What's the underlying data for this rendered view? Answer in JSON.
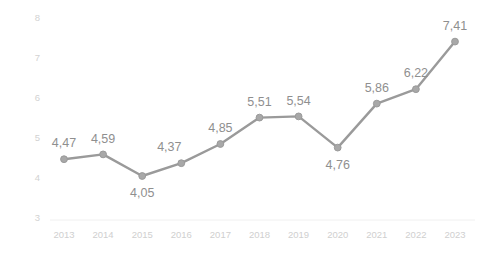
{
  "chart_data": {
    "type": "line",
    "title": "",
    "subtitle": "",
    "xlabel": "",
    "ylabel": "",
    "categories": [
      "2013",
      "2014",
      "2015",
      "2016",
      "2017",
      "2018",
      "2019",
      "2020",
      "2021",
      "2022",
      "2023"
    ],
    "values": [
      4.47,
      4.59,
      4.05,
      4.37,
      4.85,
      5.51,
      5.54,
      4.76,
      5.86,
      6.22,
      7.41
    ],
    "point_labels": [
      "4,47",
      "4,59",
      "4,05",
      "4,37",
      "4,85",
      "5,51",
      "5,54",
      "4,76",
      "5,86",
      "6,22",
      "7,41"
    ],
    "label_positions": [
      "above",
      "above",
      "below",
      "above",
      "above",
      "above",
      "above",
      "below",
      "above",
      "above",
      "above"
    ],
    "ylim": [
      3,
      8
    ],
    "yticks": [
      3,
      4,
      5,
      6,
      7,
      8
    ],
    "ytick_labels": [
      "3",
      "4",
      "5",
      "6",
      "7",
      "8"
    ],
    "xtick_labels": [
      "2013",
      "2014",
      "2015",
      "2016",
      "2017",
      "2018",
      "2019",
      "2020",
      "2021",
      "2022",
      "2023"
    ],
    "grid": false,
    "legend": null,
    "legend_position": "none",
    "series": [
      {
        "name": "series-1",
        "values": [
          4.47,
          4.59,
          4.05,
          4.37,
          4.85,
          5.51,
          5.54,
          4.76,
          5.86,
          6.22,
          7.41
        ]
      }
    ],
    "colors": {
      "line": "#9a9a9a",
      "marker": "#a8a8a8",
      "point_label": "#8f8f8f",
      "tick_label": "#d0d0d0",
      "background": "#ffffff",
      "baseline": "#f0f0f0"
    }
  }
}
